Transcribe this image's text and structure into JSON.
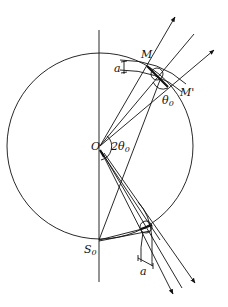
{
  "diagram": {
    "type": "geometric-optics",
    "labels": {
      "center": "O",
      "point_top": "M",
      "point_top_prime": "M'",
      "bottom_point": "S",
      "bottom_point_sub": "0",
      "angle_center": "2θ",
      "angle_center_sub": "0",
      "angle_top": "θ",
      "angle_top_sub": "0",
      "width_top": "a",
      "width_bottom": "a"
    },
    "colors": {
      "stroke": "#111111",
      "background": "#ffffff"
    }
  }
}
